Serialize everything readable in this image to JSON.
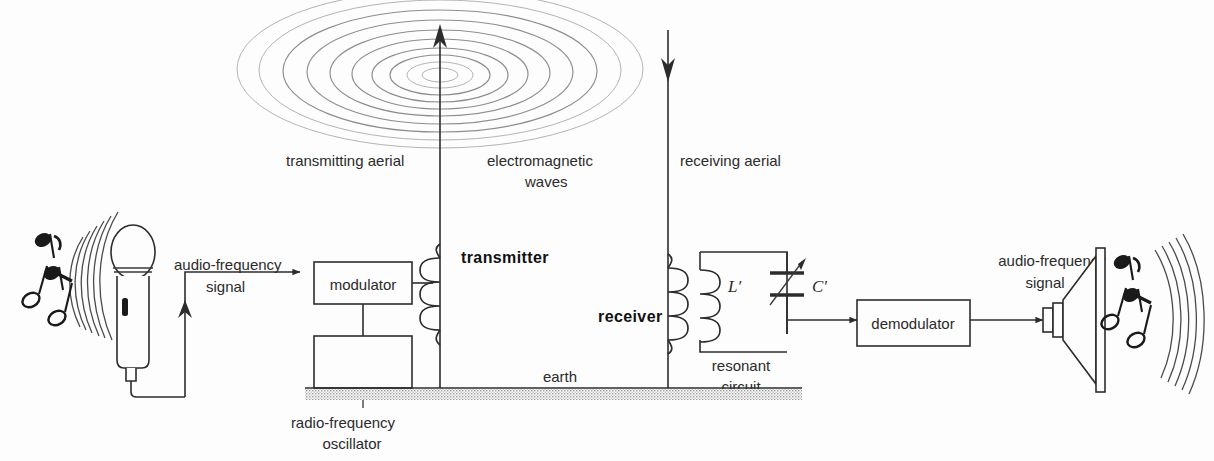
{
  "background_color": "#fdfdfd",
  "line_color": "#2c2c2c",
  "ripple_color": "#8d8d8d",
  "labels": {
    "transmitting_aerial": "transmitting aerial",
    "electromagnetic_waves_line1": "electromagnetic",
    "electromagnetic_waves_line2": "waves",
    "receiving_aerial": "receiving aerial",
    "audio_frequency_signal_left_line1": "audio-frequency",
    "audio_frequency_signal_left_line2": "signal",
    "audio_frequency_signal_right_line1": "audio-frequency",
    "audio_frequency_signal_right_line2": "signal",
    "modulator": "modulator",
    "radio_frequency_oscillator_line1": "radio-frequency",
    "radio_frequency_oscillator_line2": "oscillator",
    "transmitter": "transmitter",
    "receiver": "receiver",
    "inductor_symbol": "L′",
    "capacitor_symbol": "C′",
    "resonant_circuit_line1": "resonant",
    "resonant_circuit_line2": "circuit",
    "earth": "earth",
    "demodulator": "demodulator"
  },
  "components": [
    {
      "id": "microphone",
      "name": "microphone",
      "role": "audio input transducer"
    },
    {
      "id": "modulator",
      "name": "modulator",
      "role": "combines audio with carrier"
    },
    {
      "id": "rf-oscillator",
      "name": "radio-frequency oscillator",
      "role": "carrier source"
    },
    {
      "id": "transmitting-aerial",
      "name": "transmitting aerial",
      "role": "radiates electromagnetic waves"
    },
    {
      "id": "receiving-aerial",
      "name": "receiving aerial",
      "role": "intercepts electromagnetic waves"
    },
    {
      "id": "resonant-circuit",
      "name": "resonant circuit",
      "role": "tuned LC selector"
    },
    {
      "id": "demodulator",
      "name": "demodulator",
      "role": "recovers audio signal"
    },
    {
      "id": "loudspeaker",
      "name": "loudspeaker",
      "role": "audio output transducer"
    }
  ],
  "signal_flow": [
    "sound waves",
    "microphone",
    "audio-frequency signal",
    "modulator",
    "transmitter",
    "transmitting aerial",
    "electromagnetic waves",
    "receiving aerial",
    "receiver",
    "resonant circuit",
    "demodulator",
    "audio-frequency signal",
    "loudspeaker",
    "sound waves"
  ]
}
